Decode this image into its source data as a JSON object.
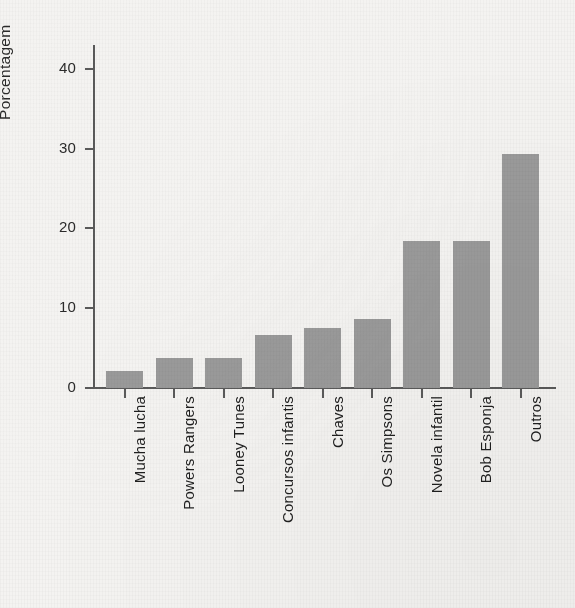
{
  "chart_data": {
    "type": "bar",
    "title": "",
    "subtitle": "",
    "xlabel": "",
    "ylabel": "Porcentagem",
    "ylim": [
      0,
      43
    ],
    "yticks": [
      0,
      10,
      20,
      30,
      40
    ],
    "ytick_labels": [
      "0",
      "10",
      "20",
      "30",
      "40"
    ],
    "grid": false,
    "legend": false,
    "bar_color": "#9a9a9a",
    "axis_color": "#5a5a5a",
    "background_color": "#f4f3f1",
    "categories": [
      "Mucha lucha",
      "Powers Rangers",
      "Looney Tunes",
      "Concursos infantis",
      "Chaves",
      "Os Simpsons",
      "Novela infantil",
      "Bob Esponja",
      "Outros"
    ],
    "values": [
      2.1,
      3.8,
      3.8,
      6.6,
      7.5,
      8.7,
      18.4,
      18.4,
      29.3
    ]
  }
}
